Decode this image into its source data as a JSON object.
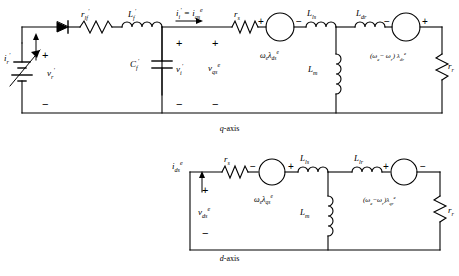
{
  "figure": {
    "captions": {
      "q_axis": "q-axis",
      "d_axis": "d-axis"
    }
  },
  "q_circuit": {
    "source": {
      "name": "variable-dc-source",
      "voltage_label": "v'r",
      "voltage_html": "v<sub>r</sub>",
      "current_label": "i'r",
      "current_html": "i<sub>r</sub>",
      "plus": "+",
      "minus": "−"
    },
    "diode": {
      "name": "diode",
      "label": ""
    },
    "filter_resistor": {
      "label_html": "r<sub>lf</sub>",
      "label": "r'lf"
    },
    "filter_inductor": {
      "label_html": "L<sub>f</sub>",
      "label": "L'f"
    },
    "filter_capacitor": {
      "label_html": "C<sub>f</sub>",
      "label": "C'f",
      "voltage_html": "v<sub>i</sub>",
      "voltage_label": "v'i",
      "plus": "+",
      "minus": "−"
    },
    "inverter_current": {
      "label_html": "i<sub>i</sub> = i<sup>e</sup><sub>qs</sub>",
      "label": "i'i = i^e_qs"
    },
    "stator_resistor": {
      "label_html": "r<sub>s</sub>",
      "label": "rs"
    },
    "stator_voltage": {
      "label_html": "v<sup>e</sup><sub>qs</sub>",
      "label": "v^e_qs",
      "plus": "+",
      "minus": "−"
    },
    "back_emf_stator": {
      "label_html": "ω<sub>e</sub>λ<sup>e</sup><sub>ds</sub>",
      "label": "we*lambda^e_ds",
      "polarity_left": "+",
      "polarity_right": "−"
    },
    "stator_leakage_inductor": {
      "label_html": "L<sub>ls</sub>",
      "label": "Lls"
    },
    "magnetizing_inductor": {
      "label_html": "L<sub>m</sub>",
      "label": "Lm"
    },
    "rotor_leakage_inductor": {
      "label_html": "L<sub>dr</sub>",
      "label": "Ldr"
    },
    "back_emf_rotor": {
      "label_html": "(ω<sub>e</sub>− ω<sub>r</sub>) λ<sup>e</sup><sub>dr</sub>",
      "label": "(we-wr)lambda^e_dr",
      "polarity_left": "−",
      "polarity_right": "+"
    },
    "rotor_resistor": {
      "label_html": "r<sub>r</sub>",
      "label": "rr"
    }
  },
  "d_circuit": {
    "current": {
      "label_html": "i<sup>e</sup><sub>ds</sub>",
      "label": "i^e_ds"
    },
    "stator_voltage": {
      "label_html": "v<sup>e</sup><sub>ds</sub>",
      "label": "v^e_ds",
      "plus": "+",
      "minus": "−"
    },
    "stator_resistor": {
      "label_html": "r<sub>s</sub>",
      "label": "rs"
    },
    "back_emf_stator": {
      "label_html": "ω<sub>e</sub>λ<sup>e</sup><sub>qs</sub>",
      "label": "we*lambda^e_qs",
      "polarity_left": "−",
      "polarity_right": "+"
    },
    "stator_leakage_inductor": {
      "label_html": "L<sub>ls</sub>",
      "label": "Lls"
    },
    "magnetizing_inductor": {
      "label_html": "L<sub>m</sub>",
      "label": "Lm"
    },
    "rotor_leakage_inductor": {
      "label_html": "L<sub>lr</sub>",
      "label": "Llr"
    },
    "back_emf_rotor": {
      "label_html": "(ω<sub>e</sub>−ω<sub>r</sub>)λ<sup>e</sup><sub>qr</sub>",
      "label": "(we-wr)lambda^e_qr",
      "polarity_left": "+",
      "polarity_right": "−"
    },
    "rotor_resistor": {
      "label_html": "r<sub>r</sub>",
      "label": "rr"
    }
  },
  "colors": {
    "line": "#000000",
    "background": "#ffffff"
  }
}
